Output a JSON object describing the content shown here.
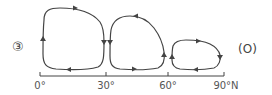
{
  "diagram": {
    "item_number": "③",
    "option_tag": "(O)",
    "axis": {
      "ticks": [
        {
          "label": "0°",
          "x": 40
        },
        {
          "label": "30°",
          "x": 106
        },
        {
          "label": "60°",
          "x": 168
        },
        {
          "label": "90°N",
          "x": 224
        }
      ]
    },
    "cells": [
      {
        "name": "cell-0-30",
        "range": "0°–30°",
        "direction": "clockwise"
      },
      {
        "name": "cell-30-60",
        "range": "30°–60°",
        "direction": "counter-clockwise"
      },
      {
        "name": "cell-60-90",
        "range": "60°–90°N",
        "direction": "clockwise"
      }
    ],
    "colors": {
      "line": "#444444",
      "text": "#444444"
    }
  }
}
